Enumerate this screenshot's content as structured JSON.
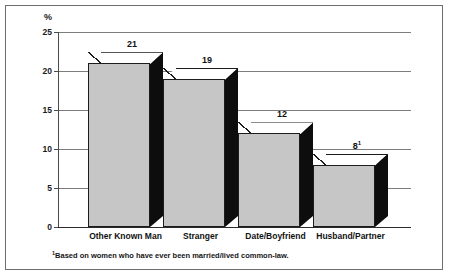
{
  "chart_data": {
    "type": "bar",
    "title": "",
    "subtitle": "",
    "xlabel": "",
    "ylabel": "%",
    "ylim": [
      0,
      25
    ],
    "yticks": [
      0,
      5,
      10,
      15,
      20,
      25
    ],
    "ytick_labels": [
      "0",
      "5",
      "10",
      "15",
      "20",
      "25"
    ],
    "grid": true,
    "legend": false,
    "style_3d": true,
    "categories": [
      "Other Known Man",
      "Stranger",
      "Date/Boyfriend",
      "Husband/Partner"
    ],
    "values": [
      21,
      19,
      12,
      8
    ],
    "value_labels": [
      "21",
      "19",
      "12",
      "8"
    ],
    "value_label_markers": [
      "",
      "",
      "",
      "1"
    ],
    "annotations": [
      "¹Based on women who have ever been married/lived common-law."
    ],
    "colors": {
      "bar_front": "#c6c6c6",
      "bar_side": "#0d0d0d",
      "bar_top": "#ffffff",
      "bar_outline": "#1c1c1c",
      "gridline": "#7d7d7d",
      "axis": "#2b2b2b",
      "text": "#111111",
      "frame": "#6e6e6e",
      "background": "#ffffff"
    }
  },
  "figure": {
    "y_unit_label": "%",
    "footnote_marker": "1",
    "footnote_text": "Based on women who have ever been married/lived common-law."
  }
}
